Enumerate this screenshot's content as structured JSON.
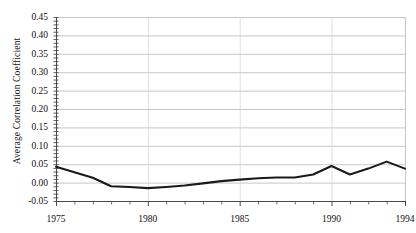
{
  "chart_data": {
    "type": "line",
    "title": "",
    "xlabel": "",
    "ylabel": "Average Correlation Coefficient",
    "xlim": [
      1975,
      1994
    ],
    "ylim": [
      -0.05,
      0.45
    ],
    "grid": true,
    "legend": null,
    "x": [
      1975,
      1976,
      1977,
      1978,
      1979,
      1980,
      1981,
      1982,
      1983,
      1984,
      1985,
      1986,
      1987,
      1988,
      1989,
      1990,
      1991,
      1992,
      1993,
      1994
    ],
    "values": [
      0.043,
      0.028,
      0.013,
      -0.01,
      -0.012,
      -0.015,
      -0.012,
      -0.008,
      -0.002,
      0.004,
      0.008,
      0.012,
      0.014,
      0.014,
      0.022,
      0.045,
      0.022,
      0.038,
      0.057,
      0.038
    ],
    "series": [
      {
        "name": "Average Correlation Coefficient",
        "values": [
          0.043,
          0.028,
          0.013,
          -0.01,
          -0.012,
          -0.015,
          -0.012,
          -0.008,
          -0.002,
          0.004,
          0.008,
          0.012,
          0.014,
          0.014,
          0.022,
          0.045,
          0.022,
          0.038,
          0.057,
          0.038
        ]
      }
    ],
    "y_ticks": [
      0.45,
      0.4,
      0.35,
      0.3,
      0.25,
      0.2,
      0.15,
      0.1,
      0.05,
      0.0,
      -0.05
    ],
    "y_tick_labels": [
      "0.45",
      "0.40",
      "0.35",
      "0.30",
      "0.25",
      "0.20",
      "0.15",
      "0.10",
      "0.05",
      "0.00",
      "-0.05"
    ],
    "x_ticks": [
      1975,
      1980,
      1985,
      1990,
      1994
    ],
    "x_tick_labels": [
      "1975",
      "1980",
      "1985",
      "1990",
      "1994"
    ],
    "line_color": "#1a1a1a",
    "grid_color": "#b9b9b9",
    "axis_color": "#4a4a4a",
    "background_color": "#ffffff"
  }
}
